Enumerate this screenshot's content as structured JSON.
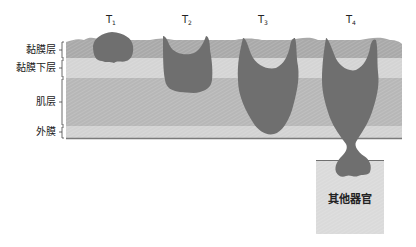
{
  "diagram": {
    "title": "",
    "stages": [
      {
        "id": "T1",
        "label": "T",
        "sub": "1"
      },
      {
        "id": "T2",
        "label": "T",
        "sub": "2"
      },
      {
        "id": "T3",
        "label": "T",
        "sub": "3"
      },
      {
        "id": "T4",
        "label": "T",
        "sub": "4"
      }
    ],
    "layers": [
      {
        "name": "黏膜层",
        "color": "#a9a9a9"
      },
      {
        "name": "黏膜下层",
        "color": "#d4d4d4"
      },
      {
        "name": "肌层",
        "color": "#b7b7b7"
      },
      {
        "name": "外膜",
        "color": "#d2d2d2"
      }
    ],
    "other_organ": {
      "label": "其他器官",
      "color": "#dadada"
    },
    "tumor_color": "#6f6f6f",
    "serosa_line_color": "#7a7a7a"
  }
}
